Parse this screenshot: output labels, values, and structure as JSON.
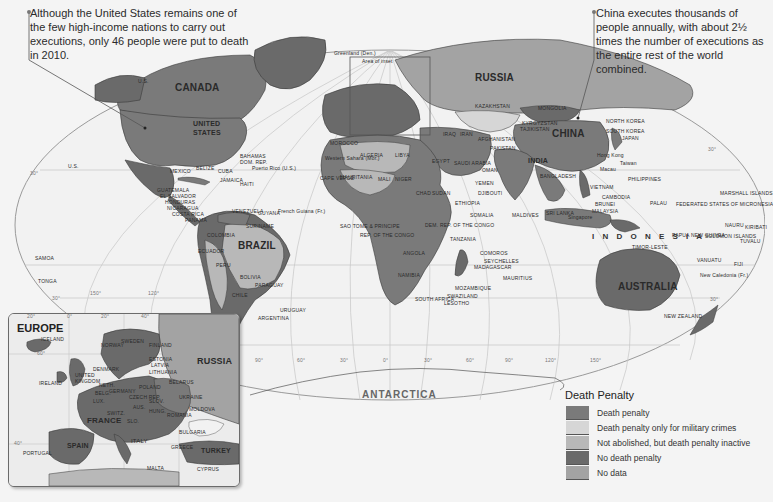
{
  "callouts": {
    "united_states": "Although the United States remains one of the few high-income nations to carry out executions, only 46 people were put to death in 2010.",
    "china": "China executes thousands of people annually, with about 2½ times the number of executions as the entire rest of the world combined."
  },
  "map": {
    "continent_labels": {
      "antarctica": "ANTARCTICA",
      "indonesia": "I N D O N E S I A"
    },
    "area_of_inset_label": "Area of inset",
    "major_countries": {
      "canada": "CANADA",
      "united_states_line1": "UNITED",
      "united_states_line2": "STATES",
      "mexico": "MEXICO",
      "brazil": "BRAZIL",
      "russia": "RUSSIA",
      "china": "CHINA",
      "india": "INDIA",
      "australia": "AUSTRALIA",
      "kazakhstan": "KAZAKHSTAN",
      "mongolia": "MONGOLIA",
      "algeria": "ALGERIA",
      "libya": "LIBYA",
      "egypt": "EGYPT",
      "sudan": "SUDAN",
      "chad": "CHAD",
      "niger": "NIGER",
      "mali": "MALI",
      "mauritania": "MAURITANIA",
      "morocco": "MOROCCO",
      "angola": "ANGOLA",
      "namibia": "NAMIBIA",
      "south_africa": "SOUTH AFRICA",
      "ethiopia": "ETHIOPIA",
      "somalia": "SOMALIA",
      "tanzania": "TANZANIA",
      "madagascar": "MADAGASCAR",
      "mozambique": "MOZAMBIQUE",
      "dem_rep_congo": "DEM. REP. OF THE CONGO",
      "saudi_arabia": "SAUDI ARABIA",
      "iran": "IRAN",
      "iraq": "IRAQ",
      "pakistan": "PAKISTAN",
      "afghanistan": "AFGHANISTAN",
      "peru": "PERU",
      "bolivia": "BOLIVIA",
      "chile": "CHILE",
      "argentina": "ARGENTINA",
      "uruguay": "URUGUAY",
      "paraguay": "PARAGUAY",
      "colombia": "COLOMBIA",
      "venezuela": "VENEZUELA",
      "ecuador": "ECUADOR",
      "suriname": "SURINAME",
      "guyana": "GUYANA",
      "philippines": "PHILIPPINES",
      "vietnam": "VIETNAM",
      "japan": "JAPAN",
      "north_korea": "NORTH KOREA",
      "south_korea": "SOUTH KOREA",
      "malaysia": "MALAYSIA",
      "new_zealand": "NEW ZEALAND",
      "papua_new_guinea": "PAPUA NEW GUINEA",
      "greenland": "Greenland (Den.)",
      "western_sahara": "Western Sahara (Mor.)",
      "french_guiana": "French Guiana (Fr.)",
      "new_caledonia": "New Caledonia (Fr.)"
    },
    "small_labels": {
      "us_alaska": "U.S.",
      "us_hawaii": "U.S.",
      "guatemala": "GUATEMALA",
      "el_salvador": "EL SALVADOR",
      "honduras": "HONDURAS",
      "nicaragua": "NICARAGUA",
      "costa_rica": "COSTA RICA",
      "panama": "PANAMA",
      "belize": "BELIZE",
      "cuba": "CUBA",
      "jamaica": "JAMAICA",
      "haiti": "HAITI",
      "bahamas": "BAHAMAS",
      "dom_rep": "DOM. REP.",
      "puerto_rico": "Puerto Rico (U.S.)",
      "cape_verde": "CAPE VERDE",
      "samoa": "SAMOA",
      "tonga": "TONGA",
      "maldives": "MALDIVES",
      "sri_lanka": "SRI LANKA",
      "singapore": "Singapore",
      "taiwan": "Taiwan",
      "hong_kong": "Hong Kong",
      "macau": "Macau",
      "palau": "PALAU",
      "micronesia": "FEDERATED STATES OF MICRONESIA",
      "marshall_islands": "MARSHALL ISLANDS",
      "nauru": "NAURU",
      "kiribati": "KIRIBATI",
      "solomon_islands": "SOLOMON ISLANDS",
      "tuvalu": "TUVALU",
      "vanuatu": "VANUATU",
      "fiji": "FIJI",
      "comoros": "COMOROS",
      "seychelles": "SEYCHELLES",
      "mauritius": "MAURITIUS",
      "swaziland": "SWAZILAND",
      "lesotho": "LESOTHO",
      "sao_tome": "SAO TOME & PRINCIPE",
      "rep_congo": "REP. OF THE CONGO",
      "timor_leste": "TIMOR-LESTE",
      "brunei": "BRUNEI",
      "cambodia": "CAMBODIA",
      "bangladesh": "BANGLADESH",
      "oman": "OMAN",
      "yemen": "YEMEN",
      "djibouti": "DJIBOUTI",
      "kyrgyzstan": "KYRGYZSTAN",
      "tajikistan": "TAJIKISTAN"
    },
    "graticule": {
      "lat_30n": "30°",
      "lat_30s": "30°",
      "lat_30n_right": "30°",
      "lat_30s_right": "30°",
      "lon_labels": [
        "150°",
        "120°",
        "90°",
        "60°",
        "30°",
        "0°",
        "30°",
        "60°",
        "90°",
        "120°",
        "150°"
      ]
    }
  },
  "inset": {
    "title": "EUROPE",
    "lon_labels": [
      "20°",
      "0°",
      "20°",
      "40°"
    ],
    "lat_labels": [
      "60°",
      "40°"
    ],
    "countries": {
      "iceland": "ICELAND",
      "norway": "NORWAY",
      "sweden": "SWEDEN",
      "finland": "FINLAND",
      "russia": "RUSSIA",
      "estonia": "ESTONIA",
      "latvia": "LATVIA",
      "lithuania": "LITHUANIA",
      "denmark": "DENMARK",
      "uk": "UNITED KINGDOM",
      "ireland": "IRELAND",
      "netherlands": "NETH.",
      "belgium": "BELG.",
      "lux": "LUX.",
      "germany": "GERMANY",
      "poland": "POLAND",
      "belarus": "BELARUS",
      "ukraine": "UKRAINE",
      "moldova": "MOLDOVA",
      "czech": "CZECH REP.",
      "slovakia": "SLOV.",
      "austria": "AUS.",
      "hungary": "HUNG.",
      "romania": "ROMANIA",
      "switz": "SWITZ.",
      "france": "FRANCE",
      "spain": "SPAIN",
      "portugal": "PORTUGAL",
      "italy": "ITALY",
      "bulgaria": "BULGARIA",
      "greece": "GREECE",
      "turkey": "TURKEY",
      "malta": "MALTA",
      "cyprus": "CYPRUS",
      "slovenia": "SLO."
    }
  },
  "legend": {
    "title": "Death Penalty",
    "items": [
      {
        "label": "Death penalty",
        "color": "#7a7a7a"
      },
      {
        "label": "Death penalty only for military crimes",
        "color": "#d6d6d6"
      },
      {
        "label": "Not abolished, but death penalty inactive",
        "color": "#b8b8b8"
      },
      {
        "label": "No death penalty",
        "color": "#6a6a6a"
      },
      {
        "label": "No data",
        "color": "#a3a3a3"
      }
    ]
  },
  "colors": {
    "ocean": "#f4f4f4",
    "land_death_penalty": "#7a7a7a",
    "land_military_only": "#d6d6d6",
    "land_inactive": "#b8b8b8",
    "land_no_death_penalty": "#6a6a6a",
    "land_no_data": "#a3a3a3",
    "graticule": "#bdbdbd",
    "border": "#3a3a3a"
  }
}
